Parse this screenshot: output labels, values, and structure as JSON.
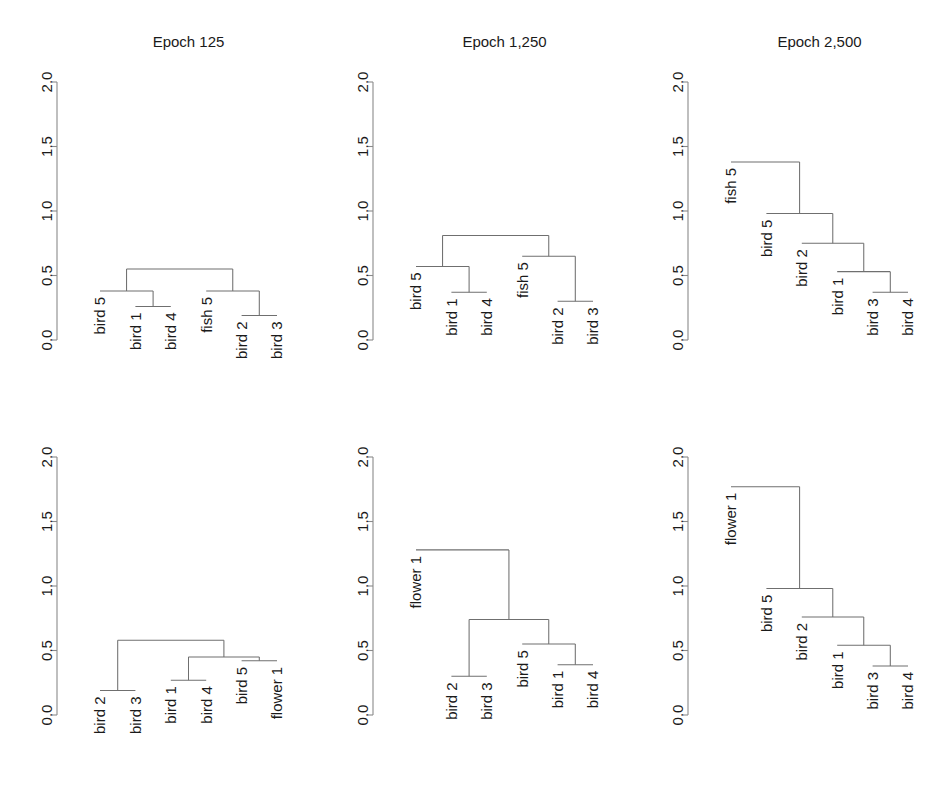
{
  "figure": {
    "width": 950,
    "height": 804,
    "background": "#ffffff",
    "line_color": "#6f6f6f",
    "axis_color": "#8a8a8a",
    "text_color": "#1a1a1a"
  },
  "axis": {
    "tick_labels": [
      "0.0",
      "0.5",
      "1.0",
      "1.5",
      "2.0"
    ],
    "tick_values": [
      0.0,
      0.5,
      1.0,
      1.5,
      2.0
    ],
    "ylim": [
      0.0,
      2.0
    ],
    "grid": false,
    "orientation": "vertical-rotated-labels"
  },
  "panels": [
    {
      "id": "panel-top-left",
      "title": "Epoch 125",
      "row": 0,
      "col": 0,
      "leaves": [
        "bird 5",
        "bird 1",
        "bird 4",
        "fish 5",
        "bird 2",
        "bird 3"
      ],
      "leaf_heights": [
        0.38,
        0.26,
        0.26,
        0.38,
        0.19,
        0.19
      ],
      "merges": [
        {
          "height": 0.26,
          "members": [
            "bird 1",
            "bird 4"
          ]
        },
        {
          "height": 0.38,
          "members": [
            "bird 5",
            "bird 1",
            "bird 4"
          ]
        },
        {
          "height": 0.19,
          "members": [
            "bird 2",
            "bird 3"
          ]
        },
        {
          "height": 0.38,
          "members": [
            "fish 5",
            "bird 2",
            "bird 3"
          ]
        },
        {
          "height": 0.55,
          "members": [
            "bird 5",
            "bird 1",
            "bird 4",
            "fish 5",
            "bird 2",
            "bird 3"
          ]
        }
      ]
    },
    {
      "id": "panel-top-middle",
      "title": "Epoch 1,250",
      "row": 0,
      "col": 1,
      "leaves": [
        "bird 5",
        "bird 1",
        "bird 4",
        "fish 5",
        "bird 2",
        "bird 3"
      ],
      "leaf_heights": [
        0.57,
        0.37,
        0.37,
        0.65,
        0.3,
        0.3
      ],
      "merges": [
        {
          "height": 0.37,
          "members": [
            "bird 1",
            "bird 4"
          ]
        },
        {
          "height": 0.57,
          "members": [
            "bird 5",
            "bird 1",
            "bird 4"
          ]
        },
        {
          "height": 0.3,
          "members": [
            "bird 2",
            "bird 3"
          ]
        },
        {
          "height": 0.65,
          "members": [
            "fish 5",
            "bird 2",
            "bird 3"
          ]
        },
        {
          "height": 0.81,
          "members": [
            "bird 5",
            "bird 1",
            "bird 4",
            "fish 5",
            "bird 2",
            "bird 3"
          ]
        }
      ]
    },
    {
      "id": "panel-top-right",
      "title": "Epoch 2,500",
      "row": 0,
      "col": 2,
      "leaves": [
        "fish 5",
        "bird 5",
        "bird 2",
        "bird 1",
        "bird 3",
        "bird 4"
      ],
      "leaf_heights": [
        1.38,
        0.98,
        0.75,
        0.53,
        0.37,
        0.37
      ],
      "merges": [
        {
          "height": 0.37,
          "members": [
            "bird 3",
            "bird 4"
          ]
        },
        {
          "height": 0.53,
          "members": [
            "bird 1",
            "bird 3",
            "bird 4"
          ]
        },
        {
          "height": 0.75,
          "members": [
            "bird 2",
            "bird 1",
            "bird 3",
            "bird 4"
          ]
        },
        {
          "height": 0.98,
          "members": [
            "bird 5",
            "bird 2",
            "bird 1",
            "bird 3",
            "bird 4"
          ]
        },
        {
          "height": 1.38,
          "members": [
            "fish 5",
            "bird 5",
            "bird 2",
            "bird 1",
            "bird 3",
            "bird 4"
          ]
        }
      ]
    },
    {
      "id": "panel-bottom-left",
      "title": "",
      "row": 1,
      "col": 0,
      "leaves": [
        "bird 2",
        "bird 3",
        "bird 1",
        "bird 4",
        "bird 5",
        "flower 1"
      ],
      "leaf_heights": [
        0.19,
        0.19,
        0.27,
        0.27,
        0.42,
        0.42
      ],
      "merges": [
        {
          "height": 0.19,
          "members": [
            "bird 2",
            "bird 3"
          ]
        },
        {
          "height": 0.27,
          "members": [
            "bird 1",
            "bird 4"
          ]
        },
        {
          "height": 0.42,
          "members": [
            "bird 5",
            "flower 1"
          ]
        },
        {
          "height": 0.45,
          "members": [
            "bird 1",
            "bird 4",
            "bird 5",
            "flower 1"
          ]
        },
        {
          "height": 0.58,
          "members": [
            "bird 2",
            "bird 3",
            "bird 1",
            "bird 4",
            "bird 5",
            "flower 1"
          ]
        }
      ]
    },
    {
      "id": "panel-bottom-middle",
      "title": "",
      "row": 1,
      "col": 1,
      "leaves": [
        "flower 1",
        "bird 2",
        "bird 3",
        "bird 5",
        "bird 1",
        "bird 4"
      ],
      "leaf_heights": [
        1.28,
        0.3,
        0.3,
        0.55,
        0.39,
        0.39
      ],
      "merges": [
        {
          "height": 0.3,
          "members": [
            "bird 2",
            "bird 3"
          ]
        },
        {
          "height": 0.39,
          "members": [
            "bird 1",
            "bird 4"
          ]
        },
        {
          "height": 0.55,
          "members": [
            "bird 5",
            "bird 1",
            "bird 4"
          ]
        },
        {
          "height": 0.74,
          "members": [
            "bird 2",
            "bird 3",
            "bird 5",
            "bird 1",
            "bird 4"
          ]
        },
        {
          "height": 1.28,
          "members": [
            "flower 1",
            "bird 2",
            "bird 3",
            "bird 5",
            "bird 1",
            "bird 4"
          ]
        }
      ]
    },
    {
      "id": "panel-bottom-right",
      "title": "",
      "row": 1,
      "col": 2,
      "leaves": [
        "flower 1",
        "bird 5",
        "bird 2",
        "bird 1",
        "bird 3",
        "bird 4"
      ],
      "leaf_heights": [
        1.77,
        0.98,
        0.76,
        0.54,
        0.38,
        0.38
      ],
      "merges": [
        {
          "height": 0.38,
          "members": [
            "bird 3",
            "bird 4"
          ]
        },
        {
          "height": 0.54,
          "members": [
            "bird 1",
            "bird 3",
            "bird 4"
          ]
        },
        {
          "height": 0.76,
          "members": [
            "bird 2",
            "bird 1",
            "bird 3",
            "bird 4"
          ]
        },
        {
          "height": 0.98,
          "members": [
            "bird 5",
            "bird 2",
            "bird 1",
            "bird 3",
            "bird 4"
          ]
        },
        {
          "height": 1.77,
          "members": [
            "flower 1",
            "bird 5",
            "bird 2",
            "bird 1",
            "bird 3",
            "bird 4"
          ]
        }
      ]
    }
  ],
  "chart_data": {
    "type": "table",
    "chart_kind": "dendrogram-grid",
    "title": "",
    "subtitle": "",
    "xlabel": "",
    "ylabel": "",
    "ylim": [
      0.0,
      2.0
    ],
    "yticks": [
      0.0,
      0.5,
      1.0,
      1.5,
      2.0
    ],
    "grid": false,
    "legend": "none",
    "layout": {
      "rows": 2,
      "cols": 3
    },
    "column_titles": [
      "Epoch 125",
      "Epoch 1,250",
      "Epoch 2,500"
    ],
    "row_titles": [
      "",
      ""
    ],
    "panels": [
      {
        "name": "Epoch 125 (row 1)",
        "leaf_order": [
          "bird 5",
          "bird 1",
          "bird 4",
          "fish 5",
          "bird 2",
          "bird 3"
        ],
        "merge_heights": [
          0.26,
          0.38,
          0.19,
          0.38,
          0.55
        ],
        "root_height": 0.55,
        "structure": "((bird 5,(bird 1,bird 4)),(fish 5,(bird 2,bird 3)))"
      },
      {
        "name": "Epoch 1,250 (row 1)",
        "leaf_order": [
          "bird 5",
          "bird 1",
          "bird 4",
          "fish 5",
          "bird 2",
          "bird 3"
        ],
        "merge_heights": [
          0.37,
          0.57,
          0.3,
          0.65,
          0.81
        ],
        "root_height": 0.81,
        "structure": "((bird 5,(bird 1,bird 4)),(fish 5,(bird 2,bird 3)))"
      },
      {
        "name": "Epoch 2,500 (row 1)",
        "leaf_order": [
          "fish 5",
          "bird 5",
          "bird 2",
          "bird 1",
          "bird 3",
          "bird 4"
        ],
        "merge_heights": [
          0.37,
          0.53,
          0.75,
          0.98,
          1.38
        ],
        "root_height": 1.38,
        "structure": "(fish 5,(bird 5,(bird 2,(bird 1,(bird 3,bird 4)))))"
      },
      {
        "name": "Epoch 125 (row 2)",
        "leaf_order": [
          "bird 2",
          "bird 3",
          "bird 1",
          "bird 4",
          "bird 5",
          "flower 1"
        ],
        "merge_heights": [
          0.19,
          0.27,
          0.42,
          0.45,
          0.58
        ],
        "root_height": 0.58,
        "structure": "((bird 2,bird 3),((bird 1,bird 4),(bird 5,flower 1)))"
      },
      {
        "name": "Epoch 1,250 (row 2)",
        "leaf_order": [
          "flower 1",
          "bird 2",
          "bird 3",
          "bird 5",
          "bird 1",
          "bird 4"
        ],
        "merge_heights": [
          0.3,
          0.39,
          0.55,
          0.74,
          1.28
        ],
        "root_height": 1.28,
        "structure": "(flower 1,((bird 2,bird 3),(bird 5,(bird 1,bird 4))))"
      },
      {
        "name": "Epoch 2,500 (row 2)",
        "leaf_order": [
          "flower 1",
          "bird 5",
          "bird 2",
          "bird 1",
          "bird 3",
          "bird 4"
        ],
        "merge_heights": [
          0.38,
          0.54,
          0.76,
          0.98,
          1.77
        ],
        "root_height": 1.77,
        "structure": "(flower 1,(bird 5,(bird 2,(bird 1,(bird 3,bird 4)))))"
      }
    ]
  }
}
